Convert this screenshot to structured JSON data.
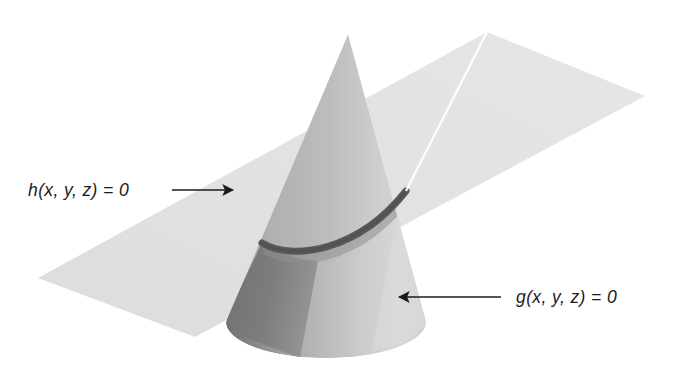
{
  "figure": {
    "type": "geometry-diagram",
    "background_color": "#ffffff",
    "annotations": [
      {
        "id": "plane-label",
        "text": "h(x, y, z) = 0",
        "target": "plane",
        "arrow_direction": "right",
        "text_x": 28,
        "text_y": 196,
        "arrow_x1": 172,
        "arrow_y1": 190,
        "arrow_x2": 239,
        "arrow_y2": 190
      },
      {
        "id": "cone-label",
        "text": "g(x, y, z) = 0",
        "target": "cone",
        "arrow_direction": "left",
        "text_x": 516,
        "text_y": 303,
        "arrow_x1": 501,
        "arrow_y1": 297,
        "arrow_x2": 393,
        "arrow_y2": 297
      }
    ],
    "surfaces": [
      {
        "id": "plane",
        "name": "plane",
        "equation": "h(x, y, z) = 0",
        "shape": "parallelogram",
        "fill": "#e3e3e3",
        "vertices": [
          [
            487,
            32
          ],
          [
            645,
            96
          ],
          [
            195,
            337
          ],
          [
            38,
            278
          ]
        ]
      },
      {
        "id": "cone",
        "name": "cone",
        "equation": "g(x, y, z) = 0",
        "shape": "cone",
        "apex": [
          348,
          34
        ],
        "base_center": [
          326,
          322
        ],
        "base_rx": 100,
        "base_ry": 36,
        "fill_light": "#b4b4b4",
        "fill_highlight": "#d2d2d2",
        "fill_shadow": "#777777"
      },
      {
        "id": "intersection-curve",
        "name": "intersection-curve",
        "shape": "arc",
        "stroke": "#595959",
        "stroke_width": 6,
        "start": [
          262,
          243
        ],
        "end": [
          406,
          192
        ]
      }
    ],
    "colors": {
      "plane": "#e3e3e3",
      "cone_lit": "#b4b4b4",
      "cone_highlight": "#d2d2d2",
      "cone_shadow": "#777777",
      "intersection": "#595959",
      "ink": "#1b1b1b",
      "background": "#ffffff"
    }
  }
}
